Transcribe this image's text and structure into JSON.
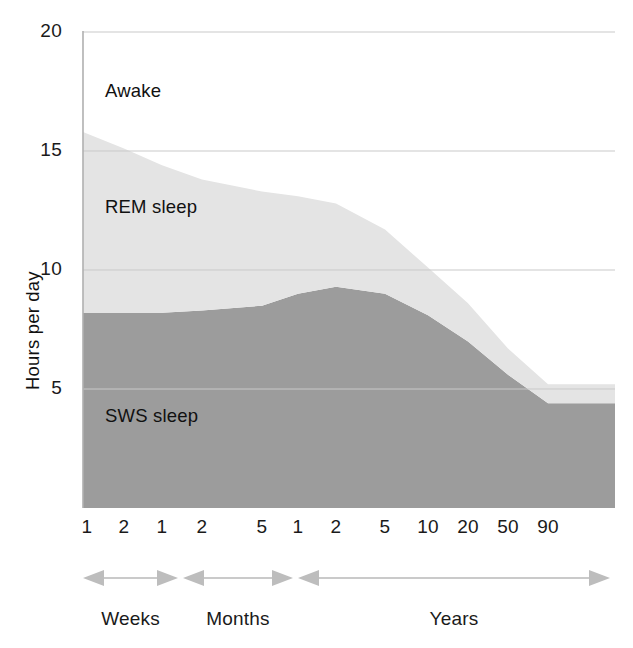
{
  "chart_data": {
    "type": "area",
    "title": "",
    "subtitle": "",
    "xlabel": "",
    "ylabel": "Hours per day",
    "ylim": [
      0,
      20
    ],
    "y_ticks": [
      "20",
      "15",
      "10",
      "5"
    ],
    "y_tick_values": [
      20,
      15,
      10,
      5
    ],
    "grid": true,
    "grid_axis": "y",
    "legend_position": "in-plot-labels",
    "stacked": true,
    "x_tick_labels": [
      "1",
      "2",
      "1",
      "2",
      "5",
      "1",
      "2",
      "5",
      "10",
      "20",
      "50",
      "90"
    ],
    "x_tick_ages": [
      "1 week",
      "2 weeks",
      "1 month",
      "2 months",
      "5 months",
      "1 year",
      "2 years",
      "5 years",
      "10 years",
      "20 years",
      "50 years",
      "90 years"
    ],
    "x_period_groups": [
      {
        "label": "Weeks",
        "ticks": [
          "1",
          "2"
        ]
      },
      {
        "label": "Months",
        "ticks": [
          "1",
          "2",
          "5"
        ]
      },
      {
        "label": "Years",
        "ticks": [
          "1",
          "2",
          "5",
          "10",
          "20",
          "50",
          "90"
        ]
      }
    ],
    "series": [
      {
        "name": "SWS sleep",
        "label": "SWS sleep",
        "color": "#9c9c9c",
        "order": 1,
        "values": [
          8.2,
          8.2,
          8.2,
          8.3,
          8.5,
          9.0,
          9.3,
          9.0,
          8.1,
          7.0,
          5.6,
          4.4
        ]
      },
      {
        "name": "REM sleep",
        "label": "REM sleep",
        "color": "#e4e4e4",
        "order": 2,
        "values": [
          7.6,
          6.9,
          6.2,
          5.5,
          4.8,
          4.1,
          3.5,
          2.7,
          2.0,
          1.6,
          1.1,
          0.8
        ]
      },
      {
        "name": "Awake",
        "label": "Awake",
        "color": "#ffffff",
        "order": 3,
        "values": [
          4.2,
          4.9,
          5.6,
          6.2,
          6.7,
          6.9,
          7.2,
          8.3,
          9.9,
          11.4,
          13.3,
          14.8
        ]
      }
    ],
    "total_sleep_hours": [
      15.8,
      15.1,
      14.4,
      13.8,
      13.3,
      13.1,
      12.8,
      11.7,
      10.1,
      8.6,
      6.7,
      5.2
    ]
  },
  "axes": {
    "y_title": "Hours per day",
    "y_ticks": [
      "20",
      "15",
      "10",
      "5"
    ],
    "x_ticks": [
      "1",
      "2",
      "1",
      "2",
      "5",
      "1",
      "2",
      "5",
      "10",
      "20",
      "50",
      "90"
    ]
  },
  "area_labels": {
    "awake": "Awake",
    "rem": "REM sleep",
    "sws": "SWS sleep"
  },
  "periods": {
    "weeks": "Weeks",
    "months": "Months",
    "years": "Years"
  },
  "colors": {
    "sws": "#9c9c9c",
    "rem": "#e4e4e4",
    "awake": "#ffffff",
    "axis": "#b8b8b8",
    "grid": "#c9c9c9",
    "arrow": "#b3b3b3",
    "text": "#111111"
  }
}
